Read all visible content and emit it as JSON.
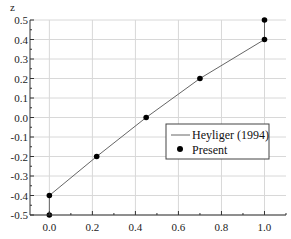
{
  "chart_data": {
    "type": "line",
    "title": "",
    "xlabel": "",
    "ylabel": "z",
    "xlim": [
      -0.09,
      1.1
    ],
    "ylim": [
      -0.5,
      0.5
    ],
    "xticks": [
      0.0,
      0.2,
      0.4,
      0.6,
      0.8,
      1.0
    ],
    "xtick_labels": [
      "0.0",
      "0.2",
      "0.4",
      "0.6",
      "0.8",
      "1.0"
    ],
    "yticks": [
      0.5,
      0.4,
      0.3,
      0.2,
      0.1,
      0.0,
      -0.1,
      -0.2,
      -0.3,
      -0.4,
      -0.5
    ],
    "ytick_labels": [
      "0.5",
      "0.4",
      "0.3",
      "0.2",
      "0.1",
      "0.0",
      "-0.1",
      "-0.2",
      "-0.3",
      "-0.4",
      "-0.5"
    ],
    "grid": true,
    "legend_position": "center-right",
    "series": [
      {
        "name": "Heyliger (1994)",
        "style": "line",
        "color": "#666666",
        "x": [
          0.0,
          0.0,
          0.22,
          0.45,
          0.7,
          1.0,
          1.0
        ],
        "y": [
          -0.5,
          -0.4,
          -0.2,
          0.0,
          0.2,
          0.4,
          0.5
        ]
      },
      {
        "name": "Present",
        "style": "marker",
        "color": "#000000",
        "x": [
          0.0,
          0.0,
          0.22,
          0.45,
          0.7,
          1.0,
          1.0
        ],
        "y": [
          -0.5,
          -0.4,
          -0.2,
          0.0,
          0.2,
          0.4,
          0.5
        ]
      }
    ]
  }
}
